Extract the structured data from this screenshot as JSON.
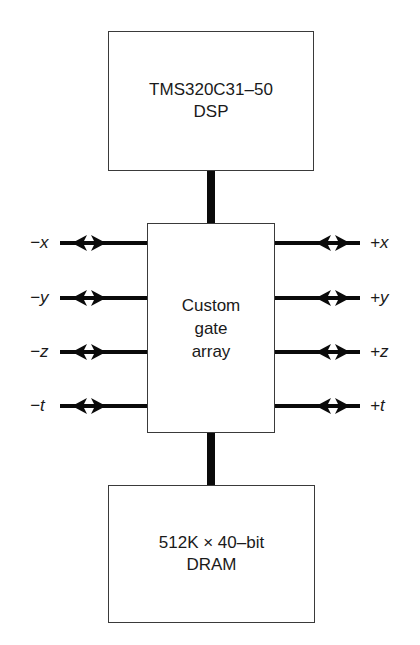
{
  "diagram": {
    "top_block": {
      "lines": [
        "TMS320C31–50",
        "DSP"
      ]
    },
    "middle_block": {
      "lines": [
        "Custom",
        "gate",
        "array"
      ]
    },
    "bottom_block": {
      "lines": [
        "512K × 40–bit",
        "DRAM"
      ]
    },
    "left_ports": [
      {
        "label": "−x",
        "y": 243
      },
      {
        "label": "−y",
        "y": 298
      },
      {
        "label": "−z",
        "y": 352
      },
      {
        "label": "−t",
        "y": 406
      }
    ],
    "right_ports": [
      {
        "label": "+x",
        "y": 243
      },
      {
        "label": "+y",
        "y": 298
      },
      {
        "label": "+z",
        "y": 352
      },
      {
        "label": "+t",
        "y": 406
      }
    ],
    "connections": [
      {
        "from": "TMS320C31–50 DSP",
        "to": "Custom gate array",
        "type": "bus"
      },
      {
        "from": "Custom gate array",
        "to": "512K × 40–bit DRAM",
        "type": "bus"
      }
    ],
    "arrow_style": "bidirectional"
  }
}
